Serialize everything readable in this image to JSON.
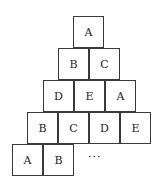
{
  "diagram": {
    "type": "letter-pyramid",
    "rows": [
      [
        "A"
      ],
      [
        "B",
        "C"
      ],
      [
        "D",
        "E",
        "A"
      ],
      [
        "B",
        "C",
        "D",
        "E"
      ],
      [
        "A",
        "B"
      ]
    ],
    "continuation": "···"
  }
}
